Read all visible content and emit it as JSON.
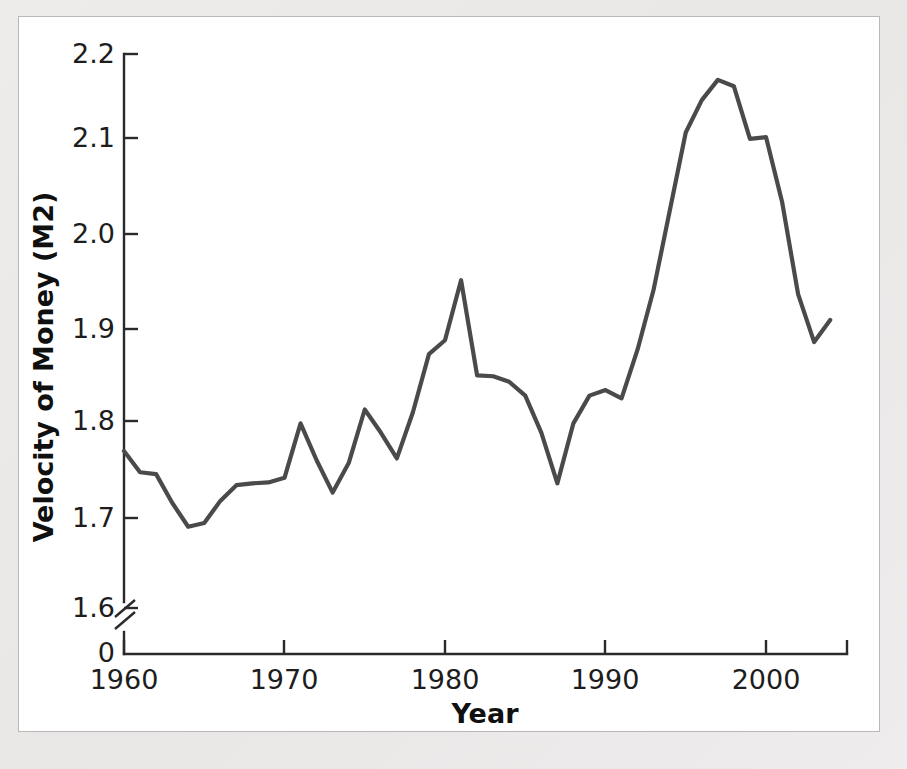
{
  "figure": {
    "background_color": "#ffffff",
    "page_background_color": "#eceaea",
    "border_color": "#b9b7b7"
  },
  "axis": {
    "x_title": "Year",
    "y_title": "Velocity of Money (M2)",
    "y_tick_labels": [
      "2.2",
      "2.1",
      "2.0",
      "1.9",
      "1.8",
      "1.7",
      "1.6",
      "0"
    ],
    "x_tick_labels": [
      "1960",
      "1970",
      "1980",
      "1990",
      "2000"
    ],
    "axis_break_present": true,
    "axis_color": "#2a2a2a"
  },
  "chart_data": {
    "type": "line",
    "title": "",
    "xlabel": "Year",
    "ylabel": "Velocity of Money (M2)",
    "xlim": [
      1960,
      2005
    ],
    "ylim": [
      1.555,
      2.22
    ],
    "grid": false,
    "legend": null,
    "line_color": "#4a4a4a",
    "y_axis_break": {
      "between": [
        0,
        1.555
      ],
      "note": "zero baseline shown below break"
    },
    "xticks": [
      1960,
      1970,
      1980,
      1990,
      2000
    ],
    "yticks": [
      1.6,
      1.7,
      1.8,
      1.9,
      2.0,
      2.1,
      2.2
    ],
    "x": [
      1960,
      1961,
      1962,
      1963,
      1964,
      1965,
      1966,
      1967,
      1968,
      1969,
      1970,
      1971,
      1972,
      1973,
      1974,
      1975,
      1976,
      1977,
      1978,
      1979,
      1980,
      1981,
      1982,
      1983,
      1984,
      1985,
      1986,
      1987,
      1988,
      1989,
      1990,
      1991,
      1992,
      1993,
      1994,
      1995,
      1996,
      1997,
      1998,
      1999,
      2000,
      2001,
      2002,
      2003,
      2004
    ],
    "values": [
      1.77,
      1.747,
      1.745,
      1.714,
      1.688,
      1.692,
      1.716,
      1.733,
      1.735,
      1.736,
      1.741,
      1.8,
      1.76,
      1.725,
      1.757,
      1.815,
      1.79,
      1.762,
      1.812,
      1.875,
      1.89,
      1.955,
      1.852,
      1.851,
      1.845,
      1.83,
      1.79,
      1.735,
      1.8,
      1.83,
      1.836,
      1.827,
      1.88,
      1.945,
      2.03,
      2.115,
      2.15,
      2.172,
      2.165,
      2.108,
      2.11,
      2.04,
      1.94,
      1.888,
      1.912
    ],
    "series": [
      {
        "name": "Velocity of Money (M2)",
        "values": [
          1.77,
          1.747,
          1.745,
          1.714,
          1.688,
          1.692,
          1.716,
          1.733,
          1.735,
          1.736,
          1.741,
          1.8,
          1.76,
          1.725,
          1.757,
          1.815,
          1.79,
          1.762,
          1.812,
          1.875,
          1.89,
          1.955,
          1.852,
          1.851,
          1.845,
          1.83,
          1.79,
          1.735,
          1.8,
          1.83,
          1.836,
          1.827,
          1.88,
          1.945,
          2.03,
          2.115,
          2.15,
          2.172,
          2.165,
          2.108,
          2.11,
          2.04,
          1.94,
          1.888,
          1.912
        ]
      }
    ]
  }
}
